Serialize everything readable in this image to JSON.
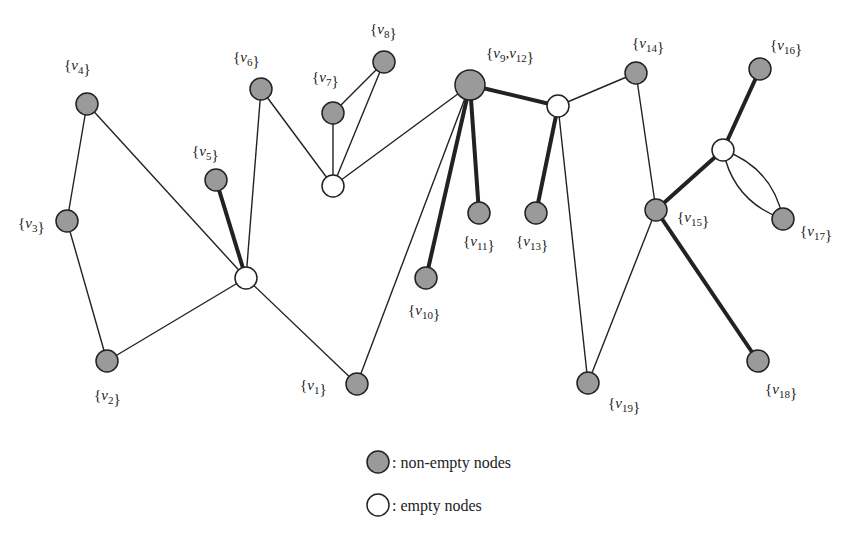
{
  "diagram": {
    "colors": {
      "nonempty_fill": "#9a9a9a",
      "empty_fill": "#ffffff",
      "stroke": "#222222",
      "background": "#ffffff"
    },
    "nodes": [
      {
        "id": "v1",
        "label": "{v1}",
        "type": "nonempty",
        "x": 357,
        "y": 384,
        "r": 11,
        "lx": 300,
        "ly": 390
      },
      {
        "id": "v2",
        "label": "{v2}",
        "type": "nonempty",
        "x": 107,
        "y": 361,
        "r": 11,
        "lx": 94,
        "ly": 400
      },
      {
        "id": "v3",
        "label": "{v3}",
        "type": "nonempty",
        "x": 67,
        "y": 221,
        "r": 11,
        "lx": 18,
        "ly": 228
      },
      {
        "id": "v4",
        "label": "{v4}",
        "type": "nonempty",
        "x": 87,
        "y": 104,
        "r": 11,
        "lx": 64,
        "ly": 70
      },
      {
        "id": "v5",
        "label": "{v5}",
        "type": "nonempty",
        "x": 216,
        "y": 180,
        "r": 11,
        "lx": 192,
        "ly": 156
      },
      {
        "id": "v6",
        "label": "{v6}",
        "type": "nonempty",
        "x": 261,
        "y": 89,
        "r": 11,
        "lx": 233,
        "ly": 62
      },
      {
        "id": "v7",
        "label": "{v7}",
        "type": "nonempty",
        "x": 333,
        "y": 113,
        "r": 11,
        "lx": 312,
        "ly": 82
      },
      {
        "id": "v8",
        "label": "{v8}",
        "type": "nonempty",
        "x": 384,
        "y": 62,
        "r": 11,
        "lx": 370,
        "ly": 34
      },
      {
        "id": "v9v12",
        "label": "{v9,v12}",
        "type": "nonempty",
        "x": 470,
        "y": 85,
        "r": 15,
        "lx": 486,
        "ly": 58
      },
      {
        "id": "v10",
        "label": "{v10}",
        "type": "nonempty",
        "x": 426,
        "y": 278,
        "r": 11,
        "lx": 408,
        "ly": 315
      },
      {
        "id": "v11",
        "label": "{v11}",
        "type": "nonempty",
        "x": 479,
        "y": 213,
        "r": 11,
        "lx": 463,
        "ly": 246
      },
      {
        "id": "v13",
        "label": "{v13}",
        "type": "nonempty",
        "x": 536,
        "y": 213,
        "r": 11,
        "lx": 516,
        "ly": 246
      },
      {
        "id": "v14",
        "label": "{v14}",
        "type": "nonempty",
        "x": 636,
        "y": 73,
        "r": 11,
        "lx": 632,
        "ly": 48
      },
      {
        "id": "v15",
        "label": "{v15}",
        "type": "nonempty",
        "x": 656,
        "y": 210,
        "r": 11,
        "lx": 677,
        "ly": 222
      },
      {
        "id": "v16",
        "label": "{v16}",
        "type": "nonempty",
        "x": 760,
        "y": 69,
        "r": 11,
        "lx": 770,
        "ly": 50
      },
      {
        "id": "v17",
        "label": "{v17}",
        "type": "nonempty",
        "x": 783,
        "y": 219,
        "r": 11,
        "lx": 800,
        "ly": 236
      },
      {
        "id": "v18",
        "label": "{v18}",
        "type": "nonempty",
        "x": 758,
        "y": 361,
        "r": 11,
        "lx": 765,
        "ly": 394
      },
      {
        "id": "v19",
        "label": "{v19}",
        "type": "nonempty",
        "x": 588,
        "y": 383,
        "r": 11,
        "lx": 608,
        "ly": 408
      },
      {
        "id": "e1",
        "label": "",
        "type": "empty",
        "x": 246,
        "y": 278,
        "r": 11
      },
      {
        "id": "e2",
        "label": "",
        "type": "empty",
        "x": 333,
        "y": 186,
        "r": 11
      },
      {
        "id": "e3",
        "label": "",
        "type": "empty",
        "x": 558,
        "y": 106,
        "r": 11
      },
      {
        "id": "e4",
        "label": "",
        "type": "empty",
        "x": 723,
        "y": 150,
        "r": 11
      }
    ],
    "edges": [
      {
        "from": "v4",
        "to": "v3",
        "weight": "thin"
      },
      {
        "from": "v4",
        "to": "e1",
        "weight": "thin"
      },
      {
        "from": "v3",
        "to": "v2",
        "weight": "thin"
      },
      {
        "from": "v2",
        "to": "e1",
        "weight": "thin"
      },
      {
        "from": "v5",
        "to": "e1",
        "weight": "thick"
      },
      {
        "from": "v6",
        "to": "e1",
        "weight": "thin"
      },
      {
        "from": "e1",
        "to": "v1",
        "weight": "thin"
      },
      {
        "from": "v6",
        "to": "e2",
        "weight": "thin"
      },
      {
        "from": "v7",
        "to": "v8",
        "weight": "thin"
      },
      {
        "from": "v7",
        "to": "e2",
        "weight": "thin"
      },
      {
        "from": "v8",
        "to": "e2",
        "weight": "thin"
      },
      {
        "from": "e2",
        "to": "v9v12",
        "weight": "thin"
      },
      {
        "from": "v9v12",
        "to": "v1",
        "weight": "thin"
      },
      {
        "from": "v9v12",
        "to": "v10",
        "weight": "thick"
      },
      {
        "from": "v9v12",
        "to": "v11",
        "weight": "thick"
      },
      {
        "from": "v9v12",
        "to": "e3",
        "weight": "thick"
      },
      {
        "from": "e3",
        "to": "v13",
        "weight": "thick"
      },
      {
        "from": "e3",
        "to": "v14",
        "weight": "thin"
      },
      {
        "from": "e3",
        "to": "v19",
        "weight": "thin"
      },
      {
        "from": "v14",
        "to": "v15",
        "weight": "thin"
      },
      {
        "from": "v15",
        "to": "v19",
        "weight": "thin"
      },
      {
        "from": "v15",
        "to": "v18",
        "weight": "thick"
      },
      {
        "from": "v15",
        "to": "e4",
        "weight": "thick"
      },
      {
        "from": "e4",
        "to": "v16",
        "weight": "thick"
      },
      {
        "from": "e4",
        "to": "v17",
        "weight": "thin",
        "curve": "upper"
      },
      {
        "from": "e4",
        "to": "v17",
        "weight": "thin",
        "curve": "lower"
      }
    ]
  },
  "legend": {
    "nonempty_label": ": non-empty nodes",
    "empty_label": ": empty nodes"
  }
}
